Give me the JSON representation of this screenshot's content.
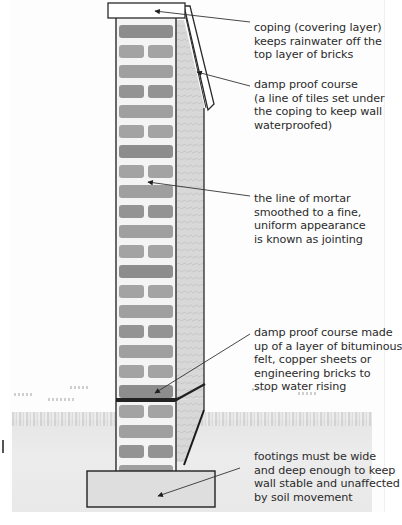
{
  "diagram": {
    "colors": {
      "brick": "#8f8f8f",
      "brick_dark": "#7a7a7a",
      "mortar": "#f4f4f4",
      "outline": "#2a2a2a",
      "footing": "#dedede",
      "coping": "#ffffff",
      "side_face": "#d4d4d4"
    },
    "annotations": [
      {
        "id": "coping",
        "text": "coping (covering layer)\nkeeps rainwater off the\ntop layer of bricks"
      },
      {
        "id": "top-dpc",
        "text": "damp proof course\n(a line of tiles set under\nthe coping to keep wall\nwaterproofed)"
      },
      {
        "id": "jointing",
        "text": "the line of mortar\nsmoothed to a fine,\nuniform appearance\nis known as jointing"
      },
      {
        "id": "lower-dpc",
        "text": "damp proof course made\nup of a layer of bituminous\nfelt, copper sheets or\nengineering bricks to\nstop water rising"
      },
      {
        "id": "footings",
        "text": "footings must be wide\nand deep enough to keep\nwall stable and unaffected\nby soil movement"
      }
    ]
  }
}
